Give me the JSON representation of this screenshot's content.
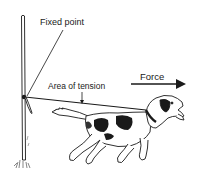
{
  "diagram": {
    "labels": {
      "fixed_point": "Fixed point",
      "area_of_tension": "Area of tension",
      "force": "Force"
    },
    "elements": [
      {
        "id": "post",
        "desc": "vertical fixed post"
      },
      {
        "id": "leash",
        "desc": "leash from post to dog collar"
      },
      {
        "id": "dog",
        "desc": "dog pulling away from post"
      },
      {
        "id": "force-arrow",
        "desc": "arrow pointing right indicating pulling force"
      }
    ],
    "colors": {
      "ink": "#1a1a1a",
      "background": "#ffffff"
    }
  }
}
